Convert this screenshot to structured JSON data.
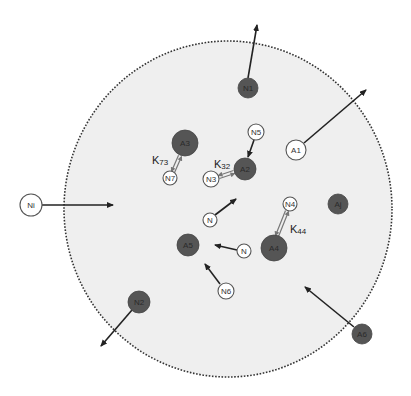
{
  "diagram": {
    "colors": {
      "region_fill": "#efefef",
      "region_border": "#333333",
      "dark_node": "#555555",
      "dark_node_text": "#2a2a2a",
      "light_node": "#ffffff",
      "light_node_stroke": "#555555",
      "arrow": "#222222",
      "double_arrow": "#777777"
    },
    "region": {
      "cx": 228,
      "cy": 209,
      "rx": 164,
      "ry": 168,
      "style": "dotted"
    },
    "nodes": [
      {
        "id": "n1",
        "label": "N1",
        "x": 248,
        "y": 88,
        "r": 10,
        "type": "dark"
      },
      {
        "id": "a1",
        "label": "A1",
        "x": 296,
        "y": 150,
        "r": 10,
        "type": "light"
      },
      {
        "id": "n5",
        "label": "N5",
        "x": 256,
        "y": 132,
        "r": 8,
        "type": "light"
      },
      {
        "id": "a2",
        "label": "A2",
        "x": 245,
        "y": 169,
        "r": 11,
        "type": "dark"
      },
      {
        "id": "n3",
        "label": "N3",
        "x": 211,
        "y": 179,
        "r": 8,
        "type": "light"
      },
      {
        "id": "a3",
        "label": "A3",
        "x": 185,
        "y": 143,
        "r": 13,
        "type": "dark"
      },
      {
        "id": "n7",
        "label": "N7",
        "x": 170,
        "y": 178,
        "r": 7,
        "type": "light"
      },
      {
        "id": "ni",
        "label": "Ni",
        "x": 31,
        "y": 205,
        "r": 11,
        "type": "light"
      },
      {
        "id": "n_a",
        "label": "N",
        "x": 210,
        "y": 220,
        "r": 7,
        "type": "light"
      },
      {
        "id": "aj",
        "label": "Aj",
        "x": 338,
        "y": 204,
        "r": 10,
        "type": "dark"
      },
      {
        "id": "n4",
        "label": "N4",
        "x": 290,
        "y": 204,
        "r": 7,
        "type": "light"
      },
      {
        "id": "a4",
        "label": "A4",
        "x": 274,
        "y": 248,
        "r": 13,
        "type": "dark"
      },
      {
        "id": "n_b",
        "label": "N",
        "x": 244,
        "y": 251,
        "r": 7,
        "type": "light"
      },
      {
        "id": "a5",
        "label": "A5",
        "x": 188,
        "y": 245,
        "r": 11,
        "type": "dark"
      },
      {
        "id": "n6",
        "label": "N6",
        "x": 226,
        "y": 291,
        "r": 8,
        "type": "light"
      },
      {
        "id": "n2",
        "label": "N2",
        "x": 139,
        "y": 302,
        "r": 11,
        "type": "dark"
      },
      {
        "id": "a6",
        "label": "A6",
        "x": 362,
        "y": 334,
        "r": 10,
        "type": "dark"
      }
    ],
    "arrows": [
      {
        "name": "n1-exit",
        "x1": 248,
        "y1": 78,
        "x2": 257,
        "y2": 25
      },
      {
        "name": "a1-exit",
        "x1": 304,
        "y1": 143,
        "x2": 366,
        "y2": 90
      },
      {
        "name": "n5-to-a2",
        "x1": 254,
        "y1": 140,
        "x2": 248,
        "y2": 157
      },
      {
        "name": "ni-entry",
        "x1": 42,
        "y1": 205,
        "x2": 113,
        "y2": 205
      },
      {
        "name": "n-to-center",
        "x1": 215,
        "y1": 215,
        "x2": 236,
        "y2": 199
      },
      {
        "name": "n-to-a5",
        "x1": 237,
        "y1": 250,
        "x2": 215,
        "y2": 245
      },
      {
        "name": "n6-to-a5",
        "x1": 220,
        "y1": 284,
        "x2": 205,
        "y2": 264
      },
      {
        "name": "n2-exit",
        "x1": 132,
        "y1": 310,
        "x2": 101,
        "y2": 346
      },
      {
        "name": "a6-entry",
        "x1": 354,
        "y1": 327,
        "x2": 305,
        "y2": 287
      }
    ],
    "double_arrows": [
      {
        "name": "k73-exchange",
        "x1": 173,
        "y1": 172,
        "x2": 180,
        "y2": 156
      },
      {
        "name": "k32-exchange",
        "x1": 219,
        "y1": 177,
        "x2": 234,
        "y2": 172
      },
      {
        "name": "k44-exchange",
        "x1": 287,
        "y1": 211,
        "x2": 277,
        "y2": 236
      }
    ],
    "rate_labels": [
      {
        "name": "k73",
        "main": "K",
        "sub": "73",
        "x": 152,
        "y": 164
      },
      {
        "name": "k32",
        "main": "K",
        "sub": "32",
        "x": 214,
        "y": 168
      },
      {
        "name": "k44",
        "main": "K",
        "sub": "44",
        "x": 290,
        "y": 233
      }
    ]
  }
}
